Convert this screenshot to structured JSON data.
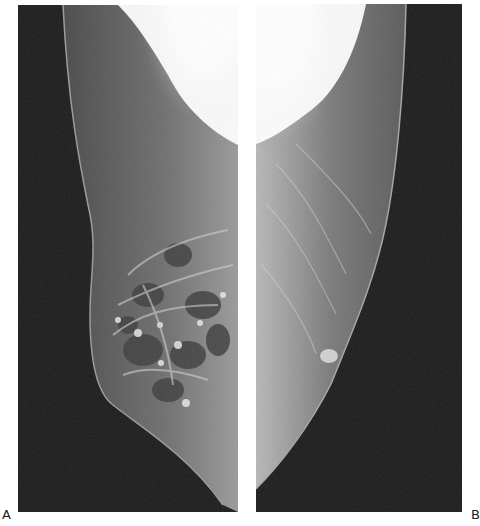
{
  "figure": {
    "panels": [
      {
        "id": "A",
        "label": "A",
        "content": "mediolateral mammogram, left panel, dense fibroglandular tissue with nodular densities"
      },
      {
        "id": "B",
        "label": "B",
        "content": "mediolateral mammogram, right panel, fatty breast with small oval density"
      }
    ],
    "colors": {
      "background": "#ffffff",
      "film_dark": "#1b1b1b",
      "tissue_mid": "#6a6a6a",
      "tissue_bright": "#ffffff"
    }
  }
}
